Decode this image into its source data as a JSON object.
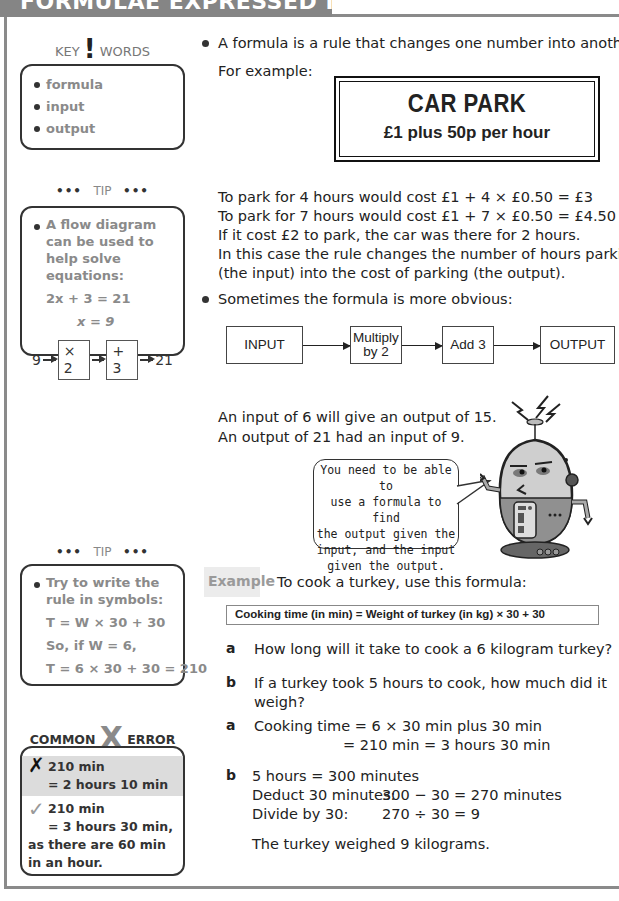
{
  "header": {
    "title": "FORMULAE EXPRESSED IN WORDS"
  },
  "sidebar": {
    "key_words": {
      "heading_left": "KEY",
      "heading_mark": "!",
      "heading_right": "WORDS",
      "items": [
        "formula",
        "input",
        "output"
      ]
    },
    "tip1": {
      "dots": "•••",
      "heading": "TIP",
      "text": "A flow diagram can be used to help solve equations:",
      "eq1": "2x + 3 = 21",
      "eq2": "x = 9",
      "flow": [
        "9",
        "× 2",
        "+ 3",
        "21"
      ]
    },
    "tip2": {
      "dots": "•••",
      "heading": "TIP",
      "text": "Try to write the rule in symbols:",
      "line1": "T = W × 30 + 30",
      "line2": "So, if W = 6,",
      "line3": "T = 6 × 30 + 30 = 210"
    },
    "common_error": {
      "heading_left": "COMMON",
      "heading_mark": "X",
      "heading_right": "ERROR",
      "wrong_mark": "✗",
      "wrong_line1": "210 min",
      "wrong_line2": "= 2 hours 10 min",
      "right_mark": "✓",
      "right_line1": "210 min",
      "right_line2": "= 3 hours 30 min,",
      "right_line3": "as there are 60 min",
      "right_line4": "in an hour."
    }
  },
  "main": {
    "intro": "A formula is a rule that changes one number into another.",
    "for_example": "For example:",
    "car_park": {
      "title": "CAR PARK",
      "subtitle": "£1 plus 50p per hour"
    },
    "lines": [
      "To park for 4 hours would cost £1 + 4 × £0.50 = £3",
      "To park for 7 hours would cost £1 + 7 × £0.50 = £4.50",
      "If it cost £2 to park, the car was there for 2 hours.",
      "In this case the rule changes the number of hours parking",
      "(the input) into the cost of parking (the output)."
    ],
    "obvious": "Sometimes the formula is more obvious:",
    "flow": {
      "input": "INPUT",
      "step1_line1": "Multiply",
      "step1_line2": "by 2",
      "step2": "Add 3",
      "output": "OUTPUT"
    },
    "io_lines": [
      "An input of 6 will give an output of 15.",
      "An output of 21 had an input of 9."
    ],
    "speech": [
      "You need to be able to",
      "use a formula to find",
      "the output given the",
      "input, and the input",
      "given the output."
    ],
    "example": {
      "tag": "Example",
      "intro": "To cook a turkey, use this formula:",
      "formula": "Cooking time (in min) = Weight of turkey (in kg) × 30 + 30",
      "qa_label": "a",
      "qa": "How long will it take to cook a 6 kilogram turkey?",
      "qb_label": "b",
      "qb_line1": "If a turkey took 5 hours to cook, how much did it",
      "qb_line2": "weigh?",
      "aa_label": "a",
      "aa_line1": "Cooking time = 6 × 30 min plus 30 min",
      "aa_line2": "= 210 min = 3 hours 30 min",
      "ab_label": "b",
      "ab_line1": "5 hours = 300 minutes",
      "ab_line2_label": "Deduct 30 minutes:",
      "ab_line2_value": "300 − 30 = 270 minutes",
      "ab_line3_label": "Divide by 30:",
      "ab_line3_value": "270 ÷ 30 = 9",
      "conclusion": "The turkey weighed 9 kilograms."
    }
  }
}
